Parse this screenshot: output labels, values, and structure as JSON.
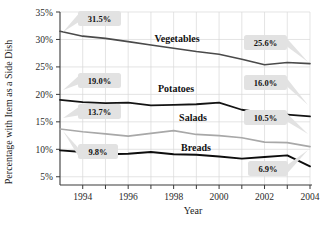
{
  "chart_data": {
    "type": "line",
    "title": "",
    "xlabel": "Year",
    "ylabel": "Percentage with Item as a Side Dish",
    "x": [
      1993,
      1994,
      1995,
      1996,
      1997,
      1998,
      1999,
      2000,
      2001,
      2002,
      2003,
      2004
    ],
    "xlim": [
      1993,
      2004
    ],
    "ylim": [
      3.5,
      35
    ],
    "xticks": [
      "1994",
      "1996",
      "1998",
      "2000",
      "2002",
      "2004"
    ],
    "xtick_values": [
      1994,
      1996,
      1998,
      2000,
      2002,
      2004
    ],
    "yticks": [
      "5%",
      "10%",
      "15%",
      "20%",
      "25%",
      "30%",
      "35%"
    ],
    "ytick_values": [
      5,
      10,
      15,
      20,
      25,
      30,
      35
    ],
    "grid": true,
    "legend": "inline-series-labels",
    "series": [
      {
        "name": "Vegetables",
        "color": "#4a4a4a",
        "width": 1.6,
        "values": [
          31.5,
          30.6,
          30.2,
          29.6,
          29.0,
          28.4,
          27.8,
          27.3,
          26.4,
          25.4,
          25.8,
          25.6
        ]
      },
      {
        "name": "Potatoes",
        "color": "#141414",
        "width": 1.8,
        "values": [
          19.0,
          18.6,
          18.4,
          18.5,
          18.0,
          18.1,
          18.2,
          18.5,
          17.2,
          16.6,
          16.3,
          16.0
        ]
      },
      {
        "name": "Salads",
        "color": "#a8a8a8",
        "width": 1.7,
        "values": [
          13.7,
          13.2,
          12.8,
          12.4,
          12.9,
          13.4,
          12.7,
          12.5,
          12.1,
          11.3,
          11.2,
          10.5
        ]
      },
      {
        "name": "Breads",
        "color": "#0d0d0d",
        "width": 1.9,
        "values": [
          9.8,
          9.5,
          9.1,
          9.2,
          9.5,
          9.1,
          9.0,
          8.7,
          8.3,
          8.6,
          8.9,
          6.9
        ]
      }
    ],
    "series_labels": [
      {
        "text": "Vegetables",
        "x": 177,
        "y": 42
      },
      {
        "text": "Potatoes",
        "x": 176,
        "y": 92
      },
      {
        "text": "Salads",
        "x": 193,
        "y": 121
      },
      {
        "text": "Breads",
        "x": 196,
        "y": 151
      }
    ],
    "annotations": [
      {
        "text": "31.5%",
        "box_x": 78,
        "box_y": 11,
        "box_w": 43,
        "box_h": 15,
        "tail_to_x": 63,
        "tail_to_y": 32
      },
      {
        "text": "25.6%",
        "box_x": 244,
        "box_y": 35,
        "box_w": 43,
        "box_h": 15,
        "tail_to_x": 308,
        "tail_to_y": 62
      },
      {
        "text": "19.0%",
        "box_x": 78,
        "box_y": 73,
        "box_w": 43,
        "box_h": 15,
        "tail_to_x": 63,
        "tail_to_y": 90
      },
      {
        "text": "16.0%",
        "box_x": 244,
        "box_y": 75,
        "box_w": 43,
        "box_h": 15,
        "tail_to_x": 308,
        "tail_to_y": 105
      },
      {
        "text": "13.7%",
        "box_x": 78,
        "box_y": 104,
        "box_w": 43,
        "box_h": 15,
        "tail_to_x": 63,
        "tail_to_y": 118
      },
      {
        "text": "10.5%",
        "box_x": 244,
        "box_y": 110,
        "box_w": 43,
        "box_h": 15,
        "tail_to_x": 308,
        "tail_to_y": 134
      },
      {
        "text": "9.8%",
        "box_x": 78,
        "box_y": 144,
        "box_w": 40,
        "box_h": 15,
        "tail_to_x": 63,
        "tail_to_y": 131
      },
      {
        "text": "6.9%",
        "box_x": 248,
        "box_y": 161,
        "box_w": 40,
        "box_h": 15,
        "tail_to_x": 308,
        "tail_to_y": 150
      }
    ]
  },
  "axes": {
    "ylabel": "Percentage with Item as a Side Dish",
    "xlabel": "Year"
  }
}
